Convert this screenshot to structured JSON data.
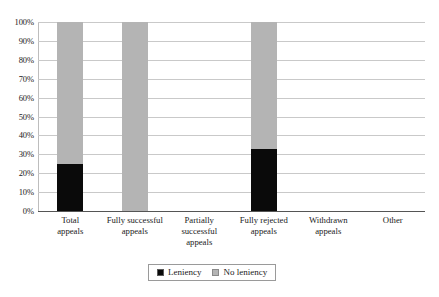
{
  "chart_data": {
    "type": "bar",
    "subtype": "stacked-100-percent",
    "title": "",
    "xlabel": "",
    "ylabel": "",
    "ylim": [
      0,
      100
    ],
    "y_unit": "%",
    "grid": true,
    "legend_position": "bottom",
    "categories": [
      "Total appeals",
      "Fully successful appeals",
      "Partially successful appeals",
      "Fully rejected appeals",
      "Withdrawn appeals",
      "Other"
    ],
    "category_lines": [
      [
        "Total",
        "appeals"
      ],
      [
        "Fully successful",
        "appeals"
      ],
      [
        "Partially",
        "successful",
        "appeals"
      ],
      [
        "Fully rejected",
        "appeals"
      ],
      [
        "Withdrawn",
        "appeals"
      ],
      [
        "Other"
      ]
    ],
    "series": [
      {
        "name": "Leniency",
        "color": "#0a0a0a",
        "values": [
          25,
          0,
          null,
          33,
          null,
          null
        ]
      },
      {
        "name": "No leniency",
        "color": "#b4b4b4",
        "values": [
          75,
          100,
          null,
          67,
          null,
          null
        ]
      }
    ],
    "y_ticks": [
      "0%",
      "10%",
      "20%",
      "30%",
      "40%",
      "50%",
      "60%",
      "70%",
      "80%",
      "90%",
      "100%"
    ],
    "y_tick_values": [
      0,
      10,
      20,
      30,
      40,
      50,
      60,
      70,
      80,
      90,
      100
    ],
    "empty_categories": [
      "Partially successful appeals",
      "Withdrawn appeals",
      "Other"
    ]
  },
  "legend": {
    "items": [
      {
        "label": "Leniency",
        "color": "#0a0a0a"
      },
      {
        "label": "No leniency",
        "color": "#b4b4b4"
      }
    ]
  },
  "colors": {
    "leniency": "#0a0a0a",
    "no_leniency": "#b4b4b4",
    "gridline": "#c9c9c9",
    "baseline": "#555555",
    "text": "#1a1a1a"
  }
}
